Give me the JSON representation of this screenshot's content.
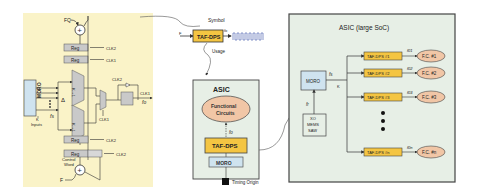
{
  "left_panel": {
    "inputs": {
      "fq": "FQ",
      "f": "F"
    },
    "regs": [
      "Reg",
      "Reg",
      "Reg",
      "Reg"
    ],
    "clocks": {
      "clk2_top": "CLK2",
      "clk1_top": "CLK1",
      "clk2_mid": "CLK2",
      "clk1_mux": "CLK1",
      "clk2_bot1": "CLK2",
      "clk2_bot2": "CLK2",
      "clk1_out": "CLK1"
    },
    "moro": "MORO",
    "k_inputs": "K\nInputs",
    "k_label": "K",
    "inputs_label": "Inputs",
    "delta": "Δ",
    "fs": "fs",
    "mux_label": "K→1",
    "mux2_label": "2→1",
    "control_word": [
      "Control",
      "Word"
    ],
    "out_label": "fo",
    "colors": {
      "background": "#faf3c8",
      "reg": "#c9c9c9",
      "moro": "#cfe3ef"
    }
  },
  "symbol": {
    "title": "Symbol",
    "block": "TAF-DPS",
    "in": "F",
    "out": "fo",
    "usage": "Usage"
  },
  "asic_small": {
    "title": "ASIC",
    "functional": [
      "Functional",
      "Circuits"
    ],
    "fs": "fo",
    "taf": "TAF-DPS",
    "moro": "MORO",
    "timing_origin": "Timing Origin",
    "colors": {
      "bg": "#e7efe6",
      "taf": "#f4c542",
      "fc": "#f1c6a6"
    }
  },
  "asic_large": {
    "title": "ASIC (large SoC)",
    "moro": "MORO",
    "fs": "fs",
    "k": "K",
    "fr": "fr",
    "osc": [
      "XO",
      "MEMS",
      "SAW"
    ],
    "channels": [
      {
        "taf": "TAF-DPS #1",
        "freq": "f01",
        "fc": "F.C. #1"
      },
      {
        "taf": "TAF-DPS #2",
        "freq": "f02",
        "fc": "F.C. #2"
      },
      {
        "taf": "TAF-DPS #3",
        "freq": "f03",
        "fc": "F.C. #3"
      },
      {
        "taf": "TAF-DPS #n",
        "freq": "f0n",
        "fc": "F.C. #n"
      }
    ]
  }
}
